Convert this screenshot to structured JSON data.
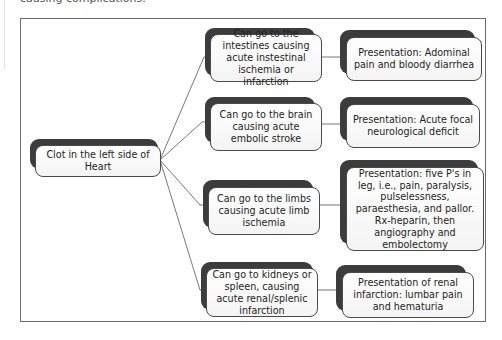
{
  "header": {
    "cut_off_text": "causing complications."
  },
  "diagram": {
    "root": {
      "label": "Clot in the left side of Heart"
    },
    "branches": [
      {
        "destination": "Can go to the intestines causing acute instestinal ischemia or infarction",
        "presentation": "Presentation: Adominal pain and bloody diarrhea"
      },
      {
        "destination": "Can go to the brain causing acute embolic stroke",
        "presentation": "Presentation: Acute focal neurological deficit"
      },
      {
        "destination": "Can go to the limbs causing acute limb ischemia",
        "presentation": "Presentation: five P's in leg, i.e., pain, paralysis, pulselessness, paraesthesia, and pallor. Rx-heparin, then angiography and embolectomy"
      },
      {
        "destination": "Can go to kidneys or spleen, causing acute renal/splenic infarction",
        "presentation": "Presentation of renal infarction: lumbar pain and hematuria"
      }
    ]
  },
  "colors": {
    "frame_border": "#6b6b6b",
    "node_shadow": "#3c3c3c",
    "node_fill": "#fbfbfb",
    "node_border": "#4a4a4a",
    "connector": "#555555"
  }
}
